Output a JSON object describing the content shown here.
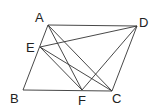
{
  "figure": {
    "points": {
      "A": {
        "label": "A",
        "x": 48,
        "y": 25,
        "label_x": 35,
        "label_y": 22
      },
      "D": {
        "label": "D",
        "x": 137,
        "y": 26,
        "label_x": 139,
        "label_y": 27
      },
      "E": {
        "label": "E",
        "x": 40,
        "y": 47,
        "label_x": 26,
        "label_y": 52
      },
      "B": {
        "label": "B",
        "x": 23,
        "y": 90,
        "label_x": 10,
        "label_y": 103
      },
      "F": {
        "label": "F",
        "x": 82,
        "y": 90,
        "label_x": 78,
        "label_y": 105
      },
      "C": {
        "label": "C",
        "x": 112,
        "y": 91,
        "label_x": 112,
        "label_y": 103
      }
    },
    "segments": [
      [
        "A",
        "D"
      ],
      [
        "D",
        "C"
      ],
      [
        "C",
        "B"
      ],
      [
        "B",
        "A"
      ],
      [
        "A",
        "F"
      ],
      [
        "A",
        "C"
      ],
      [
        "E",
        "D"
      ],
      [
        "E",
        "F"
      ],
      [
        "E",
        "C"
      ],
      [
        "D",
        "F"
      ]
    ],
    "labels": {
      "A": "A",
      "B": "B",
      "C": "C",
      "D": "D",
      "E": "E",
      "F": "F"
    }
  }
}
